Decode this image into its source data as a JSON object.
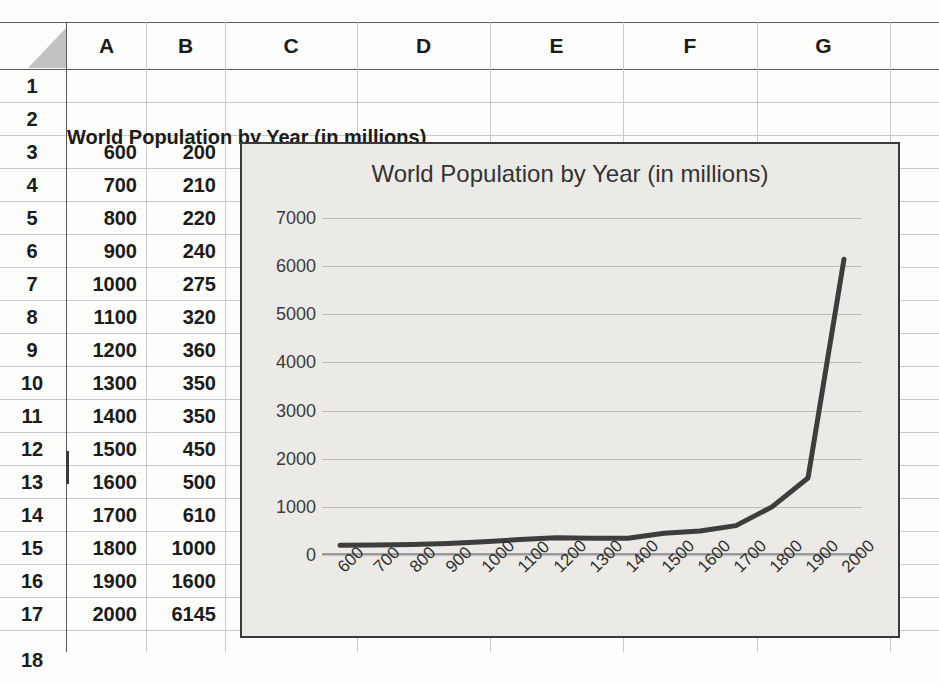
{
  "app": {
    "kind": "spreadsheet-scan",
    "colors": {
      "page": "#fdfdfc",
      "grid": "#c9c9c9",
      "header_border": "#5a5a5a",
      "chart_bg": "#eceae7",
      "chart_border": "#3a3a3a",
      "series_line": "#3d3d3d",
      "gridline": "#bdbdbd",
      "text": "#1b1b1b"
    }
  },
  "sheet": {
    "corner_name": "select-all-corner",
    "columns": [
      "A",
      "B",
      "C",
      "D",
      "E",
      "F",
      "G"
    ],
    "rows": [
      "1",
      "2",
      "3",
      "4",
      "5",
      "6",
      "7",
      "8",
      "9",
      "10",
      "11",
      "12",
      "13",
      "14",
      "15",
      "16",
      "17"
    ],
    "row_cut_off": "18",
    "title_cell": {
      "ref": "A2",
      "text": "World Population by Year (in millions)"
    },
    "active_row": "12",
    "data_rows": [
      {
        "row": "3",
        "A": "600",
        "B": "200"
      },
      {
        "row": "4",
        "A": "700",
        "B": "210"
      },
      {
        "row": "5",
        "A": "800",
        "B": "220"
      },
      {
        "row": "6",
        "A": "900",
        "B": "240"
      },
      {
        "row": "7",
        "A": "1000",
        "B": "275"
      },
      {
        "row": "8",
        "A": "1100",
        "B": "320"
      },
      {
        "row": "9",
        "A": "1200",
        "B": "360"
      },
      {
        "row": "10",
        "A": "1300",
        "B": "350"
      },
      {
        "row": "11",
        "A": "1400",
        "B": "350"
      },
      {
        "row": "12",
        "A": "1500",
        "B": "450"
      },
      {
        "row": "13",
        "A": "1600",
        "B": "500"
      },
      {
        "row": "14",
        "A": "1700",
        "B": "610"
      },
      {
        "row": "15",
        "A": "1800",
        "B": "1000"
      },
      {
        "row": "16",
        "A": "1900",
        "B": "1600"
      },
      {
        "row": "17",
        "A": "2000",
        "B": "6145"
      }
    ]
  },
  "chart_data": {
    "type": "line",
    "title": "World Population by Year (in millions)",
    "xlabel": "",
    "ylabel": "",
    "categories": [
      "600",
      "700",
      "800",
      "900",
      "1000",
      "1100",
      "1200",
      "1300",
      "1400",
      "1500",
      "1600",
      "1700",
      "1800",
      "1900",
      "2000"
    ],
    "values": [
      200,
      210,
      220,
      240,
      275,
      320,
      360,
      350,
      350,
      450,
      500,
      610,
      1000,
      1600,
      6145
    ],
    "ylim": [
      0,
      7000
    ],
    "yticks": [
      "0",
      "1000",
      "2000",
      "3000",
      "4000",
      "5000",
      "6000",
      "7000"
    ],
    "ytick_values": [
      0,
      1000,
      2000,
      3000,
      4000,
      5000,
      6000,
      7000
    ],
    "grid": true,
    "legend": "none",
    "xtick_rotation": -45,
    "series_name": "World Population"
  }
}
